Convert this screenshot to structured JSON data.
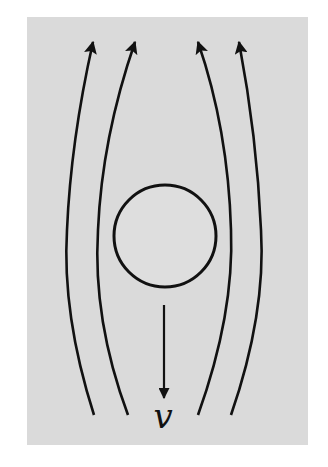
{
  "diagram": {
    "background_color": "#dadada",
    "line_color": "#111111",
    "panel": {
      "x": 27,
      "y": 17,
      "width": 281,
      "height": 428
    },
    "sphere": {
      "cx": 165,
      "cy": 236,
      "r": 51
    },
    "streamlines": [
      {
        "id": "streamline-1",
        "direction": "up",
        "path": "M 94 415 C 70 340, 64 280, 67 230 C 70 160, 80 100, 93 42"
      },
      {
        "id": "streamline-2",
        "direction": "up",
        "path": "M 128 415 C 100 340, 95 280, 98 230 C 101 160, 115 100, 135 42"
      },
      {
        "id": "streamline-3",
        "direction": "up",
        "path": "M 198 415 C 225 340, 233 280, 231 230 C 229 160, 218 100, 198 42"
      },
      {
        "id": "streamline-4",
        "direction": "up",
        "path": "M 231 415 C 257 340, 264 280, 261 230 C 258 160, 250 100, 239 42"
      }
    ],
    "velocity_arrow": {
      "label": "v",
      "x": 164,
      "y_start": 305,
      "y_end": 398,
      "direction": "down"
    }
  }
}
